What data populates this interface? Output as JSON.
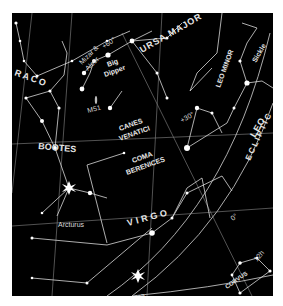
{
  "chart": {
    "background": "#000000",
    "line_color": "#cfcfcf",
    "star_color": "#ffffff",
    "constellations": [
      {
        "label": "DRACO",
        "shown": "RACO"
      },
      {
        "label": "URSA MAJOR"
      },
      {
        "label": "LEO MINOR"
      },
      {
        "label": "Sickle"
      },
      {
        "label": "BOOTES"
      },
      {
        "label": "CANES",
        "line2": "VENATICI"
      },
      {
        "label": "COMA",
        "line2": "BERENICES"
      },
      {
        "label": "LEO"
      },
      {
        "label": "VIRGO"
      },
      {
        "label": "CORVUS"
      }
    ],
    "stars": [
      {
        "label": "Mizar &",
        "line2": "Alcor"
      },
      {
        "label": "Arcturus"
      },
      {
        "label": "Spica"
      }
    ],
    "objects": [
      {
        "label": "M51"
      }
    ],
    "asterisms": [
      {
        "label": "Big",
        "line2": "Dipper"
      }
    ],
    "grid_labels": {
      "dec_60": "+60°",
      "dec_30": "+30°",
      "dec_0": "0°",
      "ra_12h": "12h"
    },
    "ecliptic_label": "ECLIPTIC"
  }
}
